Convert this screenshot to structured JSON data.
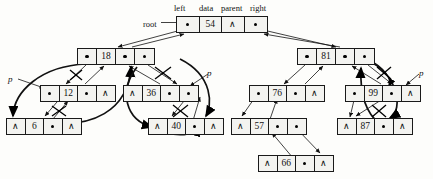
{
  "diagram": {
    "headers": {
      "left": "left",
      "data": "data",
      "parent": "parent",
      "right": "right"
    },
    "root_label": "root",
    "null_glyph": "∧",
    "pointer_glyph": "•",
    "pointer_labels": [
      {
        "id": "p-left-outer",
        "text": "p"
      },
      {
        "id": "p-left-inner",
        "text": "p"
      },
      {
        "id": "p-right",
        "text": "p"
      }
    ],
    "colors": {
      "stroke": "#1a1a1a",
      "node_fill": "#f3f3f0",
      "background": "#fdfdfb",
      "text": "#111111"
    },
    "nodes": [
      {
        "id": "n54",
        "data": "54",
        "left": "ptr",
        "parent": "nil",
        "right": "ptr",
        "x": 176,
        "y": 16,
        "w": 92,
        "h": 17
      },
      {
        "id": "n18",
        "data": "18",
        "left": "ptr",
        "parent": "ptr",
        "right": "ptr",
        "x": 77,
        "y": 48,
        "w": 78,
        "h": 17
      },
      {
        "id": "n81",
        "data": "81",
        "left": "ptr",
        "parent": "ptr",
        "right": "ptr",
        "x": 297,
        "y": 48,
        "w": 78,
        "h": 17
      },
      {
        "id": "n12",
        "data": "12",
        "left": "ptr",
        "parent": "ptr",
        "right": "nil",
        "x": 40,
        "y": 85,
        "w": 76,
        "h": 17
      },
      {
        "id": "n36",
        "data": "36",
        "left": "nil",
        "parent": "ptr",
        "right": "ptr",
        "x": 123,
        "y": 85,
        "w": 76,
        "h": 17
      },
      {
        "id": "n76",
        "data": "76",
        "left": "ptr",
        "parent": "ptr",
        "right": "nil",
        "x": 249,
        "y": 85,
        "w": 76,
        "h": 17
      },
      {
        "id": "n99",
        "data": "99",
        "left": "ptr",
        "parent": "ptr",
        "right": "nil",
        "x": 345,
        "y": 85,
        "w": 76,
        "h": 17
      },
      {
        "id": "n6",
        "data": "6",
        "left": "nil",
        "parent": "ptr",
        "right": "nil",
        "x": 6,
        "y": 118,
        "w": 76,
        "h": 17
      },
      {
        "id": "n40",
        "data": "40",
        "left": "nil",
        "parent": "ptr",
        "right": "nil",
        "x": 148,
        "y": 118,
        "w": 76,
        "h": 17
      },
      {
        "id": "n57",
        "data": "57",
        "left": "nil",
        "parent": "ptr",
        "right": "ptr",
        "x": 231,
        "y": 118,
        "w": 76,
        "h": 17
      },
      {
        "id": "n87",
        "data": "87",
        "left": "nil",
        "parent": "ptr",
        "right": "nil",
        "x": 337,
        "y": 118,
        "w": 76,
        "h": 17
      },
      {
        "id": "n66",
        "data": "66",
        "left": "nil",
        "parent": "ptr",
        "right": "nil",
        "x": 258,
        "y": 155,
        "w": 76,
        "h": 17
      }
    ]
  },
  "tree_structure": {
    "root": "54",
    "edges": [
      {
        "parent": "54",
        "left_child": "18",
        "right_child": "81"
      },
      {
        "parent": "18",
        "left_child": "12",
        "right_child": "36"
      },
      {
        "parent": "12",
        "left_child": null,
        "right_child": "6"
      },
      {
        "parent": "36",
        "left_child": null,
        "right_child": "40"
      },
      {
        "parent": "81",
        "left_child": "76",
        "right_child": "99"
      },
      {
        "parent": "76",
        "left_child": "57",
        "right_child": null
      },
      {
        "parent": "57",
        "left_child": null,
        "right_child": "66"
      },
      {
        "parent": "99",
        "left_child": "87",
        "right_child": null
      }
    ]
  }
}
